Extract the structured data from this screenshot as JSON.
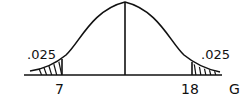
{
  "diagram": {
    "type": "normal-distribution-two-tailed",
    "axis_variable": "G",
    "left_critical_value": "7",
    "right_critical_value": "18",
    "left_tail_area": ".025",
    "right_tail_area": ".025",
    "line_color": "#111111",
    "background": "#ffffff"
  }
}
